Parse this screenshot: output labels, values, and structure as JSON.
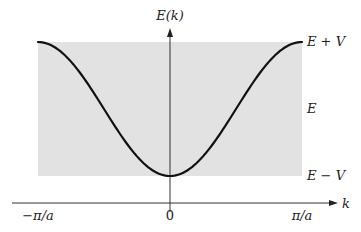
{
  "figure": {
    "y_axis_label": "E(k)",
    "x_axis_label": "k",
    "x_ticks": [
      {
        "label": "−π/a",
        "k": -1
      },
      {
        "label": "0",
        "k": 0
      },
      {
        "label": "π/a",
        "k": 1
      }
    ],
    "y_levels": [
      {
        "label": "E + V",
        "role": "band-top"
      },
      {
        "label": "E",
        "role": "band-center"
      },
      {
        "label": "E − V",
        "role": "band-bottom"
      }
    ],
    "colors": {
      "band_fill": "#e2e2e2",
      "curve": "#111111",
      "axes": "#333333",
      "text": "#222222"
    }
  },
  "chart_data": {
    "type": "line",
    "title": "",
    "xlabel": "k",
    "ylabel": "E(k)",
    "function": "E(k) = E − V cos(k a)",
    "x_tick_labels": [
      "−π/a",
      "0",
      "π/a"
    ],
    "y_tick_labels": [
      "E − V",
      "E",
      "E + V"
    ],
    "xlim": [
      "−π/a",
      "π/a"
    ],
    "ylim": [
      "E − V",
      "E + V"
    ],
    "shaded_band": {
      "from": "E − V",
      "to": "E + V",
      "k_range": [
        "−π/a",
        "π/a"
      ]
    },
    "series": [
      {
        "name": "E(k)",
        "x_in_units_of_pi_over_a": [
          -1.0,
          -0.75,
          -0.5,
          -0.25,
          0.0,
          0.25,
          0.5,
          0.75,
          1.0
        ],
        "y_in_units_of_V_relative_to_E": [
          1.0,
          0.707,
          0.0,
          -0.707,
          -1.0,
          -0.707,
          0.0,
          0.707,
          1.0
        ]
      }
    ],
    "grid": false,
    "legend": "none"
  }
}
